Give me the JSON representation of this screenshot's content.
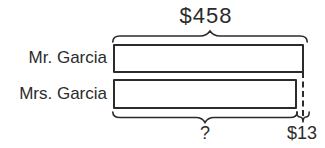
{
  "diagram": {
    "type": "tape-model",
    "total_label": "$458",
    "rows": [
      {
        "label": "Mr. Garcia"
      },
      {
        "label": "Mrs. Garcia"
      }
    ],
    "unknown_label": "?",
    "difference_label": "$13",
    "colors": {
      "line": "#2b2b2b",
      "background": "#ffffff"
    }
  }
}
